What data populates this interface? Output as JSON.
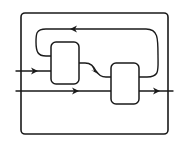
{
  "diagram": {
    "type": "block-flow-diagram",
    "stroke_color": "#1a1a1a",
    "background_color": "#ffffff",
    "boundary": {
      "label": ""
    },
    "blocks": [
      {
        "id": "block-1",
        "label": ""
      },
      {
        "id": "block-2",
        "label": ""
      }
    ],
    "connections": [
      {
        "id": "input-1",
        "from": "external",
        "to": "block-1",
        "direction": "right"
      },
      {
        "id": "input-2-bypass",
        "from": "external",
        "to": "external",
        "direction": "right",
        "passes_through": "block-2"
      },
      {
        "id": "block1-to-block2",
        "from": "block-1",
        "to": "block-2",
        "direction": "right"
      },
      {
        "id": "feedback",
        "from": "block-2",
        "to": "block-1",
        "direction": "left"
      },
      {
        "id": "output",
        "from": "block-2",
        "to": "external",
        "direction": "right"
      }
    ]
  }
}
